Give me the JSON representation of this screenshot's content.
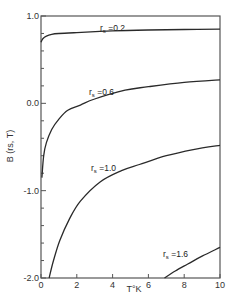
{
  "chart_data": {
    "type": "line",
    "title": "",
    "xlabel": "T°K",
    "ylabel": "B (rs, T)",
    "xlim": [
      0,
      10
    ],
    "ylim": [
      -2.0,
      1.0
    ],
    "grid": false,
    "legend": "inline labels",
    "x_ticks": [
      "0",
      "2",
      "4",
      "6",
      "8",
      "10"
    ],
    "y_ticks": [
      "1.0",
      "0.0",
      "-1.0",
      "-2.0"
    ],
    "series": [
      {
        "name": "rs = 0.2",
        "label_main": "r",
        "label_sub": "s",
        "label_value": "=0.2",
        "points": [
          [
            0.0,
            0.7
          ],
          [
            0.1,
            0.74
          ],
          [
            0.3,
            0.77
          ],
          [
            0.6,
            0.79
          ],
          [
            1.0,
            0.8
          ],
          [
            2.0,
            0.81
          ],
          [
            4.0,
            0.83
          ],
          [
            6.0,
            0.84
          ],
          [
            8.0,
            0.845
          ],
          [
            10.0,
            0.85
          ]
        ]
      },
      {
        "name": "rs = 0.6",
        "label_main": "r",
        "label_sub": "s",
        "label_value": "=0.6",
        "points": [
          [
            0.05,
            -0.85
          ],
          [
            0.15,
            -0.6
          ],
          [
            0.3,
            -0.45
          ],
          [
            0.6,
            -0.3
          ],
          [
            1.0,
            -0.18
          ],
          [
            1.5,
            -0.08
          ],
          [
            2.2,
            -0.02
          ],
          [
            3.0,
            0.05
          ],
          [
            4.7,
            0.15
          ],
          [
            6.0,
            0.19
          ],
          [
            8.0,
            0.24
          ],
          [
            10.0,
            0.27
          ]
        ]
      },
      {
        "name": "rs = 1.0",
        "label_main": "r",
        "label_sub": "s",
        "label_value": "=1.0",
        "points": [
          [
            0.45,
            -2.0
          ],
          [
            0.7,
            -1.8
          ],
          [
            1.05,
            -1.57
          ],
          [
            1.6,
            -1.32
          ],
          [
            2.2,
            -1.12
          ],
          [
            3.3,
            -0.9
          ],
          [
            4.5,
            -0.77
          ],
          [
            5.5,
            -0.7
          ],
          [
            7.0,
            -0.6
          ],
          [
            8.5,
            -0.53
          ],
          [
            10.0,
            -0.48
          ]
        ]
      },
      {
        "name": "rs = 1.6",
        "label_main": "r",
        "label_sub": "s",
        "label_value": "=1.6",
        "points": [
          [
            6.9,
            -2.0
          ],
          [
            7.5,
            -1.92
          ],
          [
            8.2,
            -1.84
          ],
          [
            9.0,
            -1.75
          ],
          [
            10.0,
            -1.65
          ]
        ]
      }
    ]
  }
}
